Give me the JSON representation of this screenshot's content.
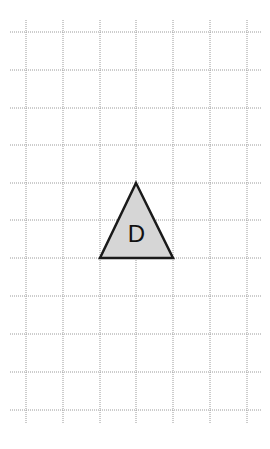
{
  "diagram": {
    "type": "grid-with-shape",
    "grid": {
      "vertical_lines_x": [
        26,
        63,
        100,
        136,
        173,
        210,
        247
      ],
      "horizontal_lines_y": [
        32,
        70,
        108,
        145,
        183,
        220,
        258,
        296,
        334,
        372,
        410
      ],
      "x_extent": [
        10,
        262
      ],
      "y_extent": [
        20,
        424
      ],
      "line_color": "#9a9a9a"
    },
    "shape": {
      "kind": "triangle",
      "label": "D",
      "points": [
        [
          136,
          183
        ],
        [
          100,
          258
        ],
        [
          173,
          258
        ]
      ],
      "fill": "#d6d6d6",
      "stroke": "#1a1a1a"
    }
  }
}
